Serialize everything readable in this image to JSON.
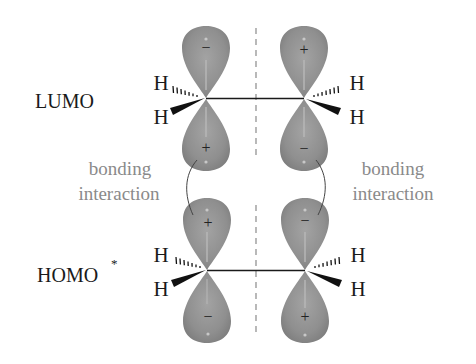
{
  "diagram": {
    "title": "",
    "orbitals": {
      "lumo": {
        "label": "LUMO",
        "left_carbon": {
          "top_sign": "−",
          "bottom_sign": "+"
        },
        "right_carbon": {
          "top_sign": "+",
          "bottom_sign": "−"
        }
      },
      "homo": {
        "label": "HOMO",
        "label_superscript": "*",
        "left_carbon": {
          "top_sign": "+",
          "bottom_sign": "−"
        },
        "right_carbon": {
          "top_sign": "−",
          "bottom_sign": "+"
        }
      }
    },
    "atoms": {
      "hydrogen": "H"
    },
    "annotations": {
      "left": {
        "line1": "bonding",
        "line2": "interaction"
      },
      "right": {
        "line1": "bonding",
        "line2": "interaction"
      }
    },
    "colors": {
      "lobe_fill": "#8f8f8f",
      "lobe_highlight": "#b5b5b5",
      "annotation_text": "#8a8a8a",
      "bond": "#1a1a1a",
      "mirror_plane": "#8a8a8a"
    }
  }
}
